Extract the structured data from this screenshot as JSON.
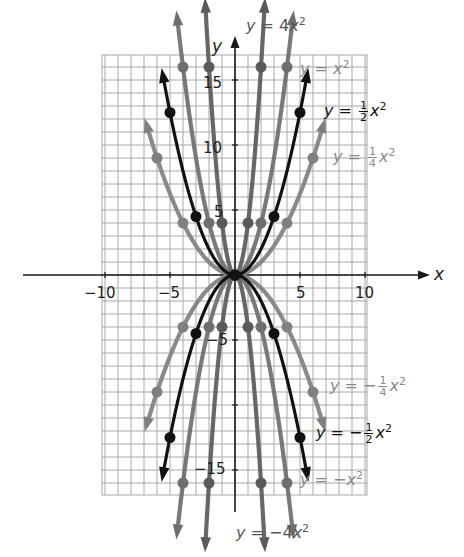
{
  "chart_data": {
    "type": "line",
    "title": "",
    "xlabel": "x",
    "ylabel": "y",
    "xlim": [
      -10,
      10
    ],
    "ylim": [
      -17,
      17
    ],
    "grid": true,
    "grid_step": 1,
    "x_ticks": [
      -10,
      -5,
      5,
      10
    ],
    "y_ticks": [
      -15,
      -5,
      5,
      10,
      15
    ],
    "x_tick_labels": [
      "−10",
      "−5",
      "5",
      "10"
    ],
    "y_tick_labels": [
      "15",
      "10",
      "5",
      "−5",
      "−15"
    ],
    "series": [
      {
        "name": "y = 4x²",
        "a": 4,
        "color": "#5a5a5a",
        "points": [
          [
            -2,
            16
          ],
          [
            -1,
            4
          ],
          [
            0,
            0
          ],
          [
            1,
            4
          ],
          [
            2,
            16
          ]
        ]
      },
      {
        "name": "y = x²",
        "a": 1,
        "color": "#6e6e6e",
        "points": [
          [
            -4,
            16
          ],
          [
            -2,
            4
          ],
          [
            0,
            0
          ],
          [
            2,
            4
          ],
          [
            4,
            16
          ]
        ]
      },
      {
        "name": "y = 1/2 x²",
        "a": 0.5,
        "color": "#111111",
        "points": [
          [
            -5,
            12.5
          ],
          [
            -3,
            4.5
          ],
          [
            0,
            0
          ],
          [
            3,
            4.5
          ],
          [
            5,
            12.5
          ]
        ]
      },
      {
        "name": "y = 1/4 x²",
        "a": 0.25,
        "color": "#808080",
        "points": [
          [
            -6,
            9
          ],
          [
            -4,
            4
          ],
          [
            0,
            0
          ],
          [
            4,
            4
          ],
          [
            6,
            9
          ]
        ]
      },
      {
        "name": "y = −1/4 x²",
        "a": -0.25,
        "color": "#808080",
        "points": [
          [
            -6,
            -9
          ],
          [
            -4,
            -4
          ],
          [
            0,
            0
          ],
          [
            4,
            -4
          ],
          [
            6,
            -9
          ]
        ]
      },
      {
        "name": "y = −1/2 x²",
        "a": -0.5,
        "color": "#111111",
        "points": [
          [
            -5,
            -12.5
          ],
          [
            -3,
            -4.5
          ],
          [
            0,
            0
          ],
          [
            3,
            -4.5
          ],
          [
            5,
            -12.5
          ]
        ]
      },
      {
        "name": "y = −x²",
        "a": -1,
        "color": "#6e6e6e",
        "points": [
          [
            -4,
            -16
          ],
          [
            -2,
            -4
          ],
          [
            0,
            0
          ],
          [
            2,
            -4
          ],
          [
            4,
            -16
          ]
        ]
      },
      {
        "name": "y = −4x²",
        "a": -4,
        "color": "#5a5a5a",
        "points": [
          [
            -2,
            -16
          ],
          [
            -1,
            -4
          ],
          [
            0,
            0
          ],
          [
            1,
            -4
          ],
          [
            2,
            -16
          ]
        ]
      }
    ],
    "annotations": [
      {
        "text": "y = 4x²",
        "position": "top"
      },
      {
        "text": "y = x²",
        "position": "right-upper"
      },
      {
        "text": "y = 1/2 x²",
        "position": "right-upper"
      },
      {
        "text": "y = 1/4 x²",
        "position": "right-upper"
      },
      {
        "text": "y = −1/4 x²",
        "position": "right-lower"
      },
      {
        "text": "y = −1/2 x²",
        "position": "right-lower"
      },
      {
        "text": "y = −x²",
        "position": "right-lower"
      },
      {
        "text": "y = −4x²",
        "position": "bottom"
      }
    ]
  },
  "labels": {
    "axis_x": "x",
    "axis_y": "y",
    "eq_4x2": {
      "y": "y",
      "eq": " = ",
      "coef": "4",
      "x": "x",
      "exp": "2"
    },
    "eq_x2": {
      "y": "y",
      "eq": " = ",
      "x": "x",
      "exp": "2"
    },
    "eq_half": {
      "y": "y",
      "eq": " = ",
      "num": "1",
      "den": "2",
      "x": "x",
      "exp": "2"
    },
    "eq_quarter": {
      "y": "y",
      "eq": " = ",
      "num": "1",
      "den": "4",
      "x": "x",
      "exp": "2"
    },
    "eq_neg_quarter": {
      "y": "y",
      "eq": " = −",
      "num": "1",
      "den": "4",
      "x": "x",
      "exp": "2"
    },
    "eq_neg_half": {
      "y": "y",
      "eq": " = −",
      "num": "1",
      "den": "2",
      "x": "x",
      "exp": "2"
    },
    "eq_neg_x2": {
      "y": "y",
      "eq": " = −",
      "x": "x",
      "exp": "2"
    },
    "eq_neg_4x2": {
      "y": "y",
      "eq": " = −",
      "coef": "4",
      "x": "x",
      "exp": "2"
    }
  },
  "colors": {
    "grid": "#a8a8a8",
    "axis": "#1a1a1a",
    "label_4x2": "#555555",
    "label_x2": "#8a8a8a",
    "label_half": "#111111",
    "label_quarter": "#8a8a8a"
  }
}
